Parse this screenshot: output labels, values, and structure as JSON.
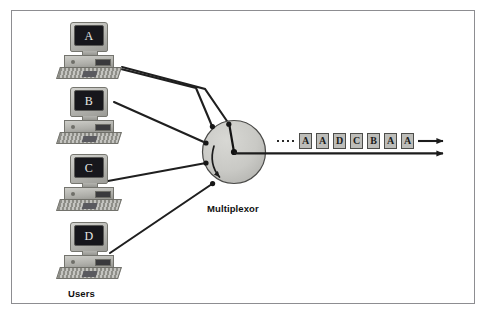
{
  "figure": {
    "frame_color": "#8d8d91",
    "background": "#ffffff"
  },
  "users": {
    "group_label": "Users",
    "workstations": [
      {
        "id": "workstation-a",
        "screen_letter": "A"
      },
      {
        "id": "workstation-b",
        "screen_letter": "B"
      },
      {
        "id": "workstation-c",
        "screen_letter": "C"
      },
      {
        "id": "workstation-d",
        "screen_letter": "D"
      }
    ]
  },
  "multiplexor": {
    "label": "Multiplexor",
    "fill_color": "#c9c9c5",
    "stroke_color": "#4a4a48",
    "rotation_direction": "clockwise",
    "input_count": 4
  },
  "output_stream": {
    "leading_dots": 4,
    "cells": [
      "A",
      "A",
      "D",
      "C",
      "B",
      "A",
      "A"
    ],
    "cell_fill": "#bdbdb9",
    "arrow_count": 2
  }
}
